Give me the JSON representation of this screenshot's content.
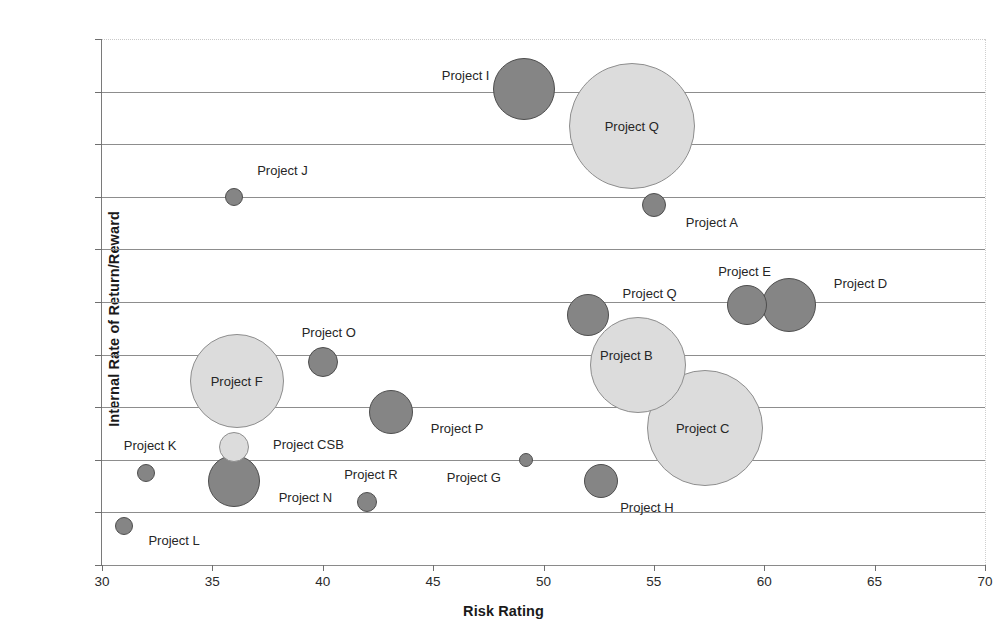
{
  "chart_data": {
    "type": "scatter",
    "title": "",
    "xlabel": "Risk Rating",
    "ylabel": "Internal Rate of Return/Reward",
    "xlim": [
      30,
      70
    ],
    "ylim": [
      0,
      200
    ],
    "xticks": [
      "30",
      "35",
      "40",
      "45",
      "50",
      "55",
      "60",
      "65",
      "70"
    ],
    "xtick_values": [
      30,
      35,
      40,
      45,
      50,
      55,
      60,
      65,
      70
    ],
    "yticks": [
      "0%",
      "20%",
      "40%",
      "60%",
      "80%",
      "100%",
      "120%",
      "140%",
      "160%",
      "180%",
      "200%"
    ],
    "ytick_values": [
      0,
      20,
      40,
      60,
      80,
      100,
      120,
      140,
      160,
      180,
      200
    ],
    "grid": true,
    "legend": "none",
    "colors": {
      "dark_bubble": "#858585",
      "dark_bubble_border": "#4e4e4e",
      "light_bubble": "#dcdcdc",
      "light_bubble_border": "#8e8e8e",
      "gridline": "#8d8d8d",
      "axis": "#7a7a7a"
    },
    "points": [
      {
        "name": "Project I",
        "x": 49.1,
        "y": 181,
        "r": 31,
        "shade": "dark",
        "label_pos": "left",
        "label_dx": -58,
        "label_dy": -14
      },
      {
        "name": "Project Q",
        "x": 54.0,
        "y": 167,
        "r": 63,
        "shade": "light",
        "label_pos": "inside",
        "label_dx": 0,
        "label_dy": 0
      },
      {
        "name": "Project A",
        "x": 55.0,
        "y": 137,
        "r": 12,
        "shade": "dark",
        "label_pos": "right",
        "label_dx": 58,
        "label_dy": 17
      },
      {
        "name": "Project J",
        "x": 36.0,
        "y": 140,
        "r": 9,
        "shade": "dark",
        "label_pos": "right",
        "label_dx": 48,
        "label_dy": -27
      },
      {
        "name": "Project Q",
        "x": 52.0,
        "y": 95,
        "r": 21,
        "shade": "dark",
        "label_pos": "right",
        "label_dx": 62,
        "label_dy": -22
      },
      {
        "name": "Project E",
        "x": 59.2,
        "y": 99,
        "r": 20,
        "shade": "dark",
        "label_pos": "above",
        "label_dx": -2,
        "label_dy": -34
      },
      {
        "name": "Project D",
        "x": 61.1,
        "y": 99,
        "r": 27,
        "shade": "dark",
        "label_pos": "right",
        "label_dx": 72,
        "label_dy": -22
      },
      {
        "name": "Project B",
        "x": 54.3,
        "y": 76,
        "r": 48,
        "shade": "light",
        "label_pos": "inside",
        "label_dx": -12,
        "label_dy": -10
      },
      {
        "name": "Project C",
        "x": 57.3,
        "y": 52,
        "r": 58,
        "shade": "light",
        "label_pos": "inside",
        "label_dx": -2,
        "label_dy": 0
      },
      {
        "name": "Project F",
        "x": 36.1,
        "y": 70,
        "r": 47,
        "shade": "light",
        "label_pos": "inside",
        "label_dx": 0,
        "label_dy": 0
      },
      {
        "name": "Project O",
        "x": 40.0,
        "y": 77,
        "r": 15,
        "shade": "dark",
        "label_pos": "above",
        "label_dx": 6,
        "label_dy": -30
      },
      {
        "name": "Project P",
        "x": 43.1,
        "y": 58,
        "r": 22,
        "shade": "dark",
        "label_pos": "right",
        "label_dx": 66,
        "label_dy": 16
      },
      {
        "name": "Project CSB",
        "x": 36.0,
        "y": 45,
        "r": 15,
        "shade": "light",
        "label_pos": "right",
        "label_dx": 74,
        "label_dy": -3
      },
      {
        "name": "Project N",
        "x": 36.0,
        "y": 32,
        "r": 26,
        "shade": "dark",
        "label_pos": "right",
        "label_dx": 71,
        "label_dy": 16
      },
      {
        "name": "Project K",
        "x": 32.0,
        "y": 35,
        "r": 9,
        "shade": "dark",
        "label_pos": "above",
        "label_dx": 4,
        "label_dy": -28
      },
      {
        "name": "Project L",
        "x": 31.0,
        "y": 15,
        "r": 9,
        "shade": "dark",
        "label_pos": "right",
        "label_dx": 50,
        "label_dy": 14
      },
      {
        "name": "Project R",
        "x": 42.0,
        "y": 24,
        "r": 10,
        "shade": "dark",
        "label_pos": "above",
        "label_dx": 4,
        "label_dy": -28
      },
      {
        "name": "Project G",
        "x": 49.2,
        "y": 40,
        "r": 7,
        "shade": "dark",
        "label_pos": "left",
        "label_dx": -52,
        "label_dy": 17
      },
      {
        "name": "Project H",
        "x": 52.6,
        "y": 32,
        "r": 17,
        "shade": "dark",
        "label_pos": "right",
        "label_dx": 46,
        "label_dy": 26
      }
    ]
  }
}
